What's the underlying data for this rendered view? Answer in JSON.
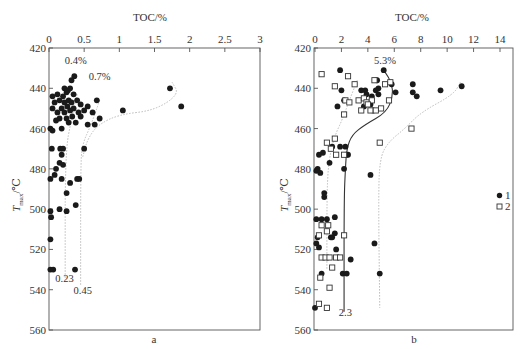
{
  "chart_data": [
    {
      "type": "scatter",
      "panel_label": "a",
      "title": "",
      "xlabel": "TOC/%",
      "ylabel": "Tmax/℃",
      "xlim": [
        0,
        3
      ],
      "ylim": [
        560,
        420
      ],
      "x_axis_position": "top",
      "y_inverted": true,
      "xticks": [
        "0",
        "0.5",
        "1",
        "1.5",
        "2",
        "2.5",
        "3"
      ],
      "yticks": [
        "420",
        "440",
        "460",
        "480",
        "500",
        "520",
        "540",
        "560"
      ],
      "grid": false,
      "annotations": [
        {
          "text": "0.4%",
          "x": 0.38,
          "y": 428
        },
        {
          "text": "0.7%",
          "x": 0.72,
          "y": 436
        },
        {
          "text": "0.23",
          "x": 0.22,
          "y": 536
        },
        {
          "text": "0.45",
          "x": 0.48,
          "y": 542
        }
      ],
      "series": [
        {
          "name": "samples",
          "marker": "filled-circle",
          "points": [
            [
              0.36,
              434
            ],
            [
              0.32,
              436
            ],
            [
              0.22,
              440
            ],
            [
              0.27,
              441
            ],
            [
              0.3,
              440
            ],
            [
              0.25,
              442
            ],
            [
              0.12,
              443
            ],
            [
              0.05,
              444
            ],
            [
              0.2,
              444
            ],
            [
              0.35,
              443
            ],
            [
              0.15,
              446
            ],
            [
              0.28,
              446
            ],
            [
              0.4,
              446
            ],
            [
              0.08,
              447
            ],
            [
              0.22,
              447
            ],
            [
              0.32,
              447
            ],
            [
              0.45,
              448
            ],
            [
              0.68,
              446
            ],
            [
              0.55,
              449
            ],
            [
              1.05,
              451
            ],
            [
              1.72,
              440
            ],
            [
              1.88,
              449
            ],
            [
              0.05,
              450
            ],
            [
              0.18,
              450
            ],
            [
              0.26,
              449
            ],
            [
              0.35,
              450
            ],
            [
              0.12,
              452
            ],
            [
              0.22,
              452
            ],
            [
              0.3,
              451
            ],
            [
              0.42,
              452
            ],
            [
              0.5,
              451
            ],
            [
              0.62,
              452
            ],
            [
              0.15,
              455
            ],
            [
              0.25,
              455
            ],
            [
              0.33,
              454
            ],
            [
              0.45,
              454
            ],
            [
              0.1,
              456
            ],
            [
              0.28,
              457
            ],
            [
              0.38,
              457
            ],
            [
              0.55,
              458
            ],
            [
              0.72,
              455
            ],
            [
              0.65,
              458
            ],
            [
              0.02,
              460
            ],
            [
              0.05,
              461
            ],
            [
              0.18,
              460
            ],
            [
              0.04,
              470
            ],
            [
              0.16,
              470
            ],
            [
              0.2,
              470
            ],
            [
              0.5,
              470
            ],
            [
              0.18,
              473
            ],
            [
              0.15,
              477
            ],
            [
              0.2,
              478
            ],
            [
              0.1,
              480
            ],
            [
              0.08,
              483
            ],
            [
              0.02,
              485
            ],
            [
              0.18,
              485
            ],
            [
              0.4,
              485
            ],
            [
              0.43,
              485
            ],
            [
              0.3,
              487
            ],
            [
              0.25,
              492
            ],
            [
              0.15,
              500
            ],
            [
              0.25,
              501
            ],
            [
              0.02,
              501
            ],
            [
              0.03,
              504
            ],
            [
              0.38,
              498
            ],
            [
              0.02,
              515
            ],
            [
              0.02,
              530
            ],
            [
              0.06,
              530
            ],
            [
              0.37,
              530
            ]
          ]
        }
      ],
      "trend_lines": [
        {
          "style": "dotted",
          "label": "0.4% → 0.23",
          "points": [
            [
              0.4,
              443
            ],
            [
              0.32,
              455
            ],
            [
              0.23,
              472
            ],
            [
              0.23,
              535
            ]
          ]
        },
        {
          "style": "dotted",
          "label": "0.7% → 0.45",
          "points": [
            [
              0.72,
              446
            ],
            [
              0.6,
              458
            ],
            [
              0.47,
              468
            ],
            [
              0.45,
              480
            ],
            [
              0.45,
              538
            ]
          ]
        },
        {
          "style": "dotted",
          "label": "high-TOC trend",
          "points": [
            [
              1.75,
              437
            ],
            [
              1.85,
              443
            ],
            [
              1.5,
              451
            ],
            [
              1.0,
              453
            ],
            [
              0.7,
              458
            ],
            [
              0.55,
              465
            ],
            [
              0.48,
              474
            ]
          ]
        }
      ]
    },
    {
      "type": "scatter",
      "panel_label": "b",
      "title": "",
      "xlabel": "TOC/%",
      "ylabel": "Tmax/℃",
      "xlim": [
        0,
        15
      ],
      "ylim": [
        560,
        420
      ],
      "x_axis_position": "top",
      "y_inverted": true,
      "xticks": [
        "0",
        "2",
        "4",
        "6",
        "8",
        "10",
        "12",
        "14"
      ],
      "yticks": [
        "420",
        "440",
        "460",
        "480",
        "500",
        "520",
        "540",
        "560"
      ],
      "grid": false,
      "legend": {
        "position": "right",
        "entries": [
          {
            "label": "1",
            "marker": "filled-circle"
          },
          {
            "label": "2",
            "marker": "open-square"
          }
        ]
      },
      "annotations": [
        {
          "text": "5.3%",
          "x": 5.3,
          "y": 428
        },
        {
          "text": "2.3",
          "x": 2.3,
          "y": 553
        }
      ],
      "series": [
        {
          "name": "1",
          "marker": "filled-circle",
          "points": [
            [
              1.9,
              431
            ],
            [
              5.2,
              431
            ],
            [
              4.7,
              436
            ],
            [
              4.8,
              440
            ],
            [
              5.8,
              438
            ],
            [
              7.4,
              438
            ],
            [
              11.1,
              439
            ],
            [
              2.0,
              441
            ],
            [
              3.5,
              441
            ],
            [
              3.8,
              441
            ],
            [
              4.6,
              441
            ],
            [
              6.1,
              442
            ],
            [
              7.4,
              442
            ],
            [
              9.5,
              441
            ],
            [
              7.7,
              444
            ],
            [
              3.9,
              443
            ],
            [
              4.8,
              443
            ],
            [
              4.3,
              444
            ],
            [
              2.2,
              446
            ],
            [
              4.2,
              448
            ],
            [
              3.7,
              449
            ],
            [
              1.7,
              449
            ],
            [
              4.4,
              451
            ],
            [
              1.3,
              469
            ],
            [
              1.9,
              469
            ],
            [
              0.6,
              472
            ],
            [
              0.3,
              473
            ],
            [
              1.1,
              477
            ],
            [
              0.2,
              480
            ],
            [
              0.1,
              481
            ],
            [
              0.4,
              482
            ],
            [
              2.3,
              469
            ],
            [
              2.4,
              473
            ],
            [
              2.5,
              473
            ],
            [
              2.2,
              480
            ],
            [
              4.2,
              483
            ],
            [
              0.7,
              492
            ],
            [
              0.7,
              494
            ],
            [
              0.1,
              505
            ],
            [
              0.5,
              505
            ],
            [
              0.9,
              505
            ],
            [
              1.5,
              504
            ],
            [
              0.2,
              514
            ],
            [
              1.2,
              514
            ],
            [
              1.3,
              514
            ],
            [
              1.5,
              512
            ],
            [
              0.1,
              517
            ],
            [
              0.3,
              519
            ],
            [
              1.6,
              520
            ],
            [
              4.5,
              517
            ],
            [
              2.7,
              525
            ],
            [
              0.5,
              532
            ],
            [
              2.1,
              532
            ],
            [
              2.4,
              532
            ],
            [
              4.9,
              532
            ],
            [
              0.0,
              549
            ]
          ]
        },
        {
          "name": "2",
          "marker": "open-square",
          "points": [
            [
              0.5,
              433
            ],
            [
              2.5,
              434
            ],
            [
              1.5,
              439
            ],
            [
              3.0,
              438
            ],
            [
              4.5,
              436
            ],
            [
              5.3,
              438
            ],
            [
              5.7,
              437
            ],
            [
              2.3,
              446
            ],
            [
              2.6,
              447
            ],
            [
              3.3,
              446
            ],
            [
              3.7,
              445
            ],
            [
              3.9,
              447
            ],
            [
              4.3,
              446
            ],
            [
              4.0,
              448
            ],
            [
              5.6,
              446
            ],
            [
              2.2,
              453
            ],
            [
              3.5,
              451
            ],
            [
              4.2,
              451
            ],
            [
              4.6,
              451
            ],
            [
              5.0,
              450
            ],
            [
              7.3,
              460
            ],
            [
              0.9,
              467
            ],
            [
              1.5,
              465
            ],
            [
              1.2,
              470
            ],
            [
              1.6,
              473
            ],
            [
              2.2,
              473
            ],
            [
              4.9,
              467
            ],
            [
              0.5,
              508
            ],
            [
              1.0,
              508
            ],
            [
              2.2,
              513
            ],
            [
              0.3,
              513
            ],
            [
              0.5,
              524
            ],
            [
              0.8,
              524
            ],
            [
              1.1,
              524
            ],
            [
              1.6,
              524
            ],
            [
              1.9,
              524
            ],
            [
              1.3,
              529
            ],
            [
              0.4,
              534
            ],
            [
              1.1,
              539
            ],
            [
              0.3,
              547
            ],
            [
              0.9,
              549
            ],
            [
              0.9,
              511
            ]
          ]
        }
      ],
      "trend_lines": [
        {
          "style": "solid",
          "label": "5.3% → 2.3",
          "points": [
            [
              5.3,
              432
            ],
            [
              5.8,
              437
            ],
            [
              5.9,
              444
            ],
            [
              5.4,
              452
            ],
            [
              3.8,
              458
            ],
            [
              2.8,
              463
            ],
            [
              2.4,
              470
            ],
            [
              2.3,
              480
            ],
            [
              2.2,
              495
            ],
            [
              2.2,
              551
            ]
          ]
        },
        {
          "style": "dotted",
          "label": "left envelope",
          "points": [
            [
              3.2,
              436
            ],
            [
              2.6,
              446
            ],
            [
              2.1,
              455
            ],
            [
              1.4,
              465
            ],
            [
              1.0,
              478
            ],
            [
              0.9,
              495
            ],
            [
              0.9,
              530
            ]
          ]
        },
        {
          "style": "dotted",
          "label": "right envelope",
          "points": [
            [
              11.0,
              437
            ],
            [
              10.5,
              443
            ],
            [
              8.0,
              452
            ],
            [
              6.8,
              460
            ],
            [
              5.5,
              467
            ],
            [
              4.9,
              475
            ],
            [
              4.8,
              495
            ],
            [
              4.9,
              549
            ]
          ]
        }
      ]
    }
  ]
}
